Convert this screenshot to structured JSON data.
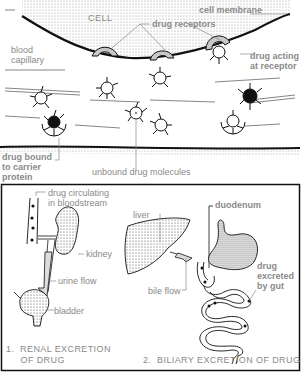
{
  "top_panel": {
    "labels": {
      "cell": "CELL",
      "cell_membrane": "cell membrane",
      "drug_receptors": "drug receptors",
      "blood_capillary": "blood\ncapillary",
      "drug_acting_at_receptor": "drug acting\nat receptor",
      "drug_bound_to_carrier_protein": "drug bound\nto carrier\nprotein",
      "unbound_drug_molecules": "unbound drug molecules"
    }
  },
  "renal_panel": {
    "labels": {
      "drug_circulating": "drug circulating\nin bloodstream",
      "kidney": "kidney",
      "urine_flow": "urine flow",
      "bladder": "bladder"
    },
    "title": "1.  RENAL EXCRETION\n     OF DRUG"
  },
  "biliary_panel": {
    "labels": {
      "liver": "liver",
      "duodenum": "duodenum",
      "bile_flow": "bile flow",
      "drug_excreted_by_gut": "drug\nexcreted\nby gut"
    },
    "title": "2.  BILIARY EXCRETION OF DRUG"
  },
  "colors": {
    "ink": "#1a1a1a",
    "label": "#8a8a8a",
    "receptor_fill": "#c8c8c8",
    "background": "#ffffff"
  }
}
